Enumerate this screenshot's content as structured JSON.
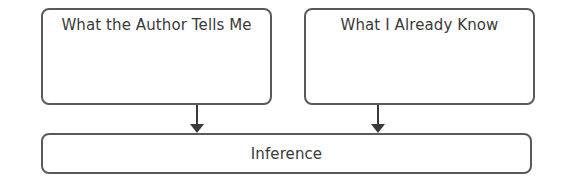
{
  "diagram": {
    "type": "inference-graphic-organizer",
    "boxes": {
      "author": {
        "label": "What the Author Tells Me"
      },
      "know": {
        "label": "What I Already Know"
      },
      "inference": {
        "label": "Inference"
      }
    },
    "arrows": [
      {
        "from": "author",
        "to": "inference"
      },
      {
        "from": "know",
        "to": "inference"
      }
    ],
    "colors": {
      "stroke": "#5a5a5a",
      "text": "#3a3a3a",
      "background": "#ffffff"
    }
  }
}
